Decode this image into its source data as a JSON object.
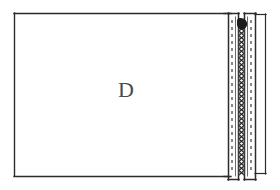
{
  "figure": {
    "kind": "technical-line-drawing",
    "background_color": "#ffffff",
    "ink_color": "#2b2b2b",
    "soft_ink_color": "#5a5a5a",
    "blob_color": "#1c1c1c",
    "canvas": {
      "width": 280,
      "height": 190
    },
    "labels": [
      {
        "id": "panel-label",
        "text": "D",
        "x": 118,
        "y": 97
      }
    ],
    "parts": [
      {
        "id": "panel-body",
        "name": "panel-body-rectangle",
        "x": 14,
        "y": 13,
        "width": 214,
        "height": 163
      },
      {
        "id": "left-channel",
        "name": "left-u-channel",
        "x": 228,
        "y": 13,
        "width": 11,
        "height": 167
      },
      {
        "id": "right-channel",
        "name": "right-u-channel",
        "x": 244,
        "y": 13,
        "width": 11,
        "height": 167
      },
      {
        "id": "coil-element",
        "name": "coil-spring-zigzag",
        "x": 239,
        "y": 22,
        "width": 5,
        "height": 153
      },
      {
        "id": "sealant-blob",
        "name": "sealant-blob",
        "cx": 242,
        "cy": 25,
        "rx": 5,
        "ry": 5
      },
      {
        "id": "outer-reference-line",
        "name": "outer-reference-edge",
        "x": 265,
        "y1": 15,
        "y2": 174
      }
    ],
    "notes": {
      "coil_segments": 34,
      "dash_pattern": "3 4"
    }
  }
}
